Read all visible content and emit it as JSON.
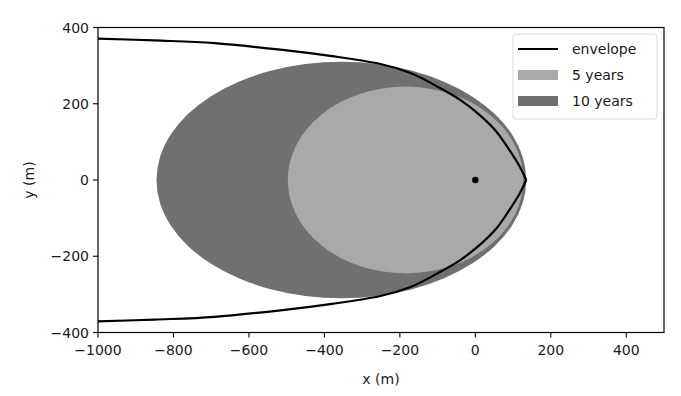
{
  "chart_data": {
    "type": "area",
    "title": "",
    "xlabel": "x (m)",
    "ylabel": "y (m)",
    "xlim": [
      -1000,
      500
    ],
    "ylim": [
      -400,
      400
    ],
    "xticks": [
      -1000,
      -800,
      -600,
      -400,
      -200,
      0,
      200,
      400
    ],
    "yticks": [
      -400,
      -200,
      0,
      200,
      400
    ],
    "xtick_labels": [
      "−1000",
      "−800",
      "−600",
      "−400",
      "−200",
      "0",
      "200",
      "400"
    ],
    "ytick_labels": [
      "−400",
      "−200",
      "0",
      "200",
      "400"
    ],
    "grid": false,
    "legend_position": "upper right",
    "series": [
      {
        "name": "envelope",
        "kind": "line",
        "color": "#000000",
        "upper_branch": [
          [
            -1000,
            371
          ],
          [
            -850,
            366
          ],
          [
            -691,
            359
          ],
          [
            -500,
            340
          ],
          [
            -380,
            325
          ],
          [
            -254,
            305
          ],
          [
            -170,
            280
          ],
          [
            -95,
            242
          ],
          [
            -40,
            210
          ],
          [
            11,
            171
          ],
          [
            55,
            128
          ],
          [
            90,
            79
          ],
          [
            115,
            40
          ],
          [
            135,
            0
          ]
        ]
      },
      {
        "name": "5 years",
        "kind": "filled-ellipse",
        "color": "#a9a9a9",
        "center": [
          -185,
          0
        ],
        "rx": 312,
        "ry": 245
      },
      {
        "name": "10 years",
        "kind": "filled-ellipse",
        "color": "#707070",
        "center": [
          -355,
          0
        ],
        "rx": 490,
        "ry": 310
      }
    ],
    "annotations": [
      {
        "kind": "point",
        "x": 0,
        "y": 0,
        "color": "#000000"
      }
    ]
  },
  "legend": {
    "items": [
      {
        "label": "envelope",
        "swatch": "line",
        "color": "#000000"
      },
      {
        "label": "5 years",
        "swatch": "patch",
        "color": "#a9a9a9"
      },
      {
        "label": "10 years",
        "swatch": "patch",
        "color": "#707070"
      }
    ]
  }
}
